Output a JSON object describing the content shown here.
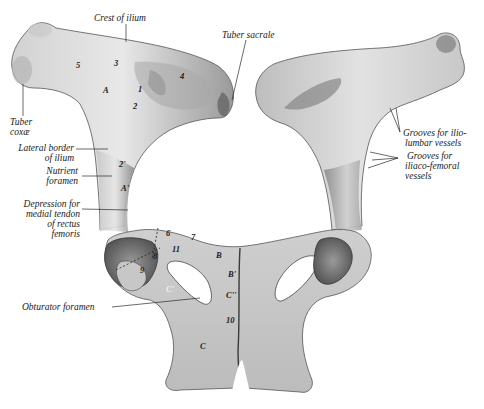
{
  "figure": {
    "colors": {
      "background": "#ffffff",
      "bone_light": "#e4e4e4",
      "bone_mid": "#bdbdbd",
      "bone_dark": "#6e6e6e",
      "ink": "#1a1a1a"
    }
  },
  "labels": {
    "crest_of_ilium": "Crest of ilium",
    "tuber_sacrale": "Tuber sacrale",
    "tuber_coxae_1": "Tuber",
    "tuber_coxae_2": "coxæ",
    "lateral_border_1": "Lateral border",
    "lateral_border_2": "of ilium",
    "nutrient_foramen_1": "Nutrient",
    "nutrient_foramen_2": "foramen",
    "depression_1": "Depression for",
    "depression_2": "medial tendon",
    "depression_3": "of rectus",
    "depression_4": "femoris",
    "grooves_iliolumbar_1": "Grooves for ilio-",
    "grooves_iliolumbar_2": "lumbar vessels",
    "grooves_iliacofemoral_1": "Grooves for",
    "grooves_iliacofemoral_2": "iliaco-femoral",
    "grooves_iliacofemoral_3": "vessels",
    "obturator_foramen": "Obturator foramen"
  },
  "markers": {
    "m5": "5",
    "m3": "3",
    "A": "A",
    "m1": "1",
    "m4": "4",
    "m2": "2",
    "m2p": "2'",
    "Ap": "A'",
    "m6": "6",
    "m7": "7",
    "m11": "11",
    "m8": "8",
    "m9": "9",
    "B": "B",
    "Bp": "B'",
    "Cp": "C'",
    "Cpp": "C''",
    "m10": "10",
    "C": "C"
  }
}
